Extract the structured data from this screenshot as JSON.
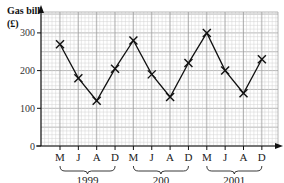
{
  "chart_data": {
    "type": "line",
    "title": "",
    "ylabel": "Gas bill (£)",
    "ylabel_line1": "Gas bill",
    "ylabel_line2": "(£)",
    "xlabel": "",
    "ylim": [
      0,
      300
    ],
    "yticks": [
      0,
      100,
      200,
      300
    ],
    "grid": true,
    "categories": [
      "M",
      "J",
      "A",
      "D",
      "M",
      "J",
      "A",
      "D",
      "M",
      "J",
      "A",
      "D"
    ],
    "year_groups": [
      {
        "label": "1999",
        "start": 0,
        "end": 3
      },
      {
        "label": "200",
        "start": 4,
        "end": 7
      },
      {
        "label": "2001",
        "start": 8,
        "end": 11
      }
    ],
    "series": [
      {
        "name": "Gas bill",
        "marker": "x",
        "values": [
          270,
          180,
          120,
          205,
          280,
          190,
          130,
          220,
          300,
          200,
          140,
          230
        ]
      }
    ]
  }
}
